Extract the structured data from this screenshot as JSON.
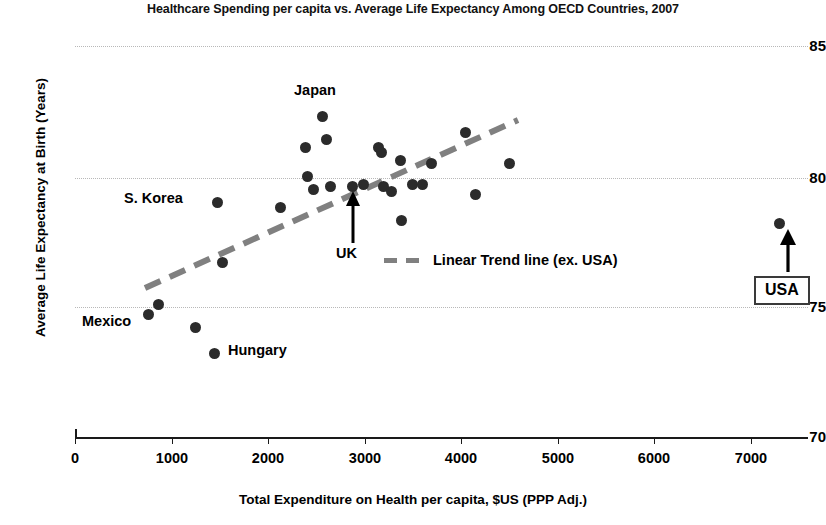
{
  "chart_data": {
    "type": "scatter",
    "title": "Healthcare Spending per capita vs. Average Life Expectancy Among OECD Countries, 2007",
    "xlabel": "Total Expenditure on Health per capita, $US (PPP Adj.)",
    "ylabel": "Average Life Expectancy at Birth (Years)",
    "xlim": [
      0,
      7600
    ],
    "ylim": [
      70,
      85
    ],
    "xticks": [
      0,
      1000,
      2000,
      3000,
      4000,
      5000,
      6000,
      7000
    ],
    "xtick_labels": [
      "0",
      "1000",
      "2000",
      "3000",
      "4000",
      "5000",
      "6000",
      "7000"
    ],
    "yticks": [
      70,
      75,
      80,
      85
    ],
    "ytick_labels": [
      "70",
      "75",
      "80",
      "85"
    ],
    "grid": "horizontal-dotted",
    "marker_color": "#2b2b2b",
    "trendline_color": "#808080",
    "points": [
      {
        "x": 760,
        "y": 74.7,
        "label": "Mexico"
      },
      {
        "x": 870,
        "y": 75.1,
        "label": ""
      },
      {
        "x": 1250,
        "y": 74.2,
        "label": ""
      },
      {
        "x": 1450,
        "y": 73.2,
        "label": "Hungary"
      },
      {
        "x": 1480,
        "y": 79.0,
        "label": "S. Korea"
      },
      {
        "x": 1530,
        "y": 76.7,
        "label": ""
      },
      {
        "x": 2130,
        "y": 78.8,
        "label": ""
      },
      {
        "x": 2390,
        "y": 81.1,
        "label": ""
      },
      {
        "x": 2410,
        "y": 80.0,
        "label": ""
      },
      {
        "x": 2470,
        "y": 79.5,
        "label": ""
      },
      {
        "x": 2570,
        "y": 82.3,
        "label": "Japan"
      },
      {
        "x": 2610,
        "y": 81.4,
        "label": ""
      },
      {
        "x": 2650,
        "y": 79.6,
        "label": ""
      },
      {
        "x": 2880,
        "y": 79.6,
        "label": "UK"
      },
      {
        "x": 2990,
        "y": 79.7,
        "label": ""
      },
      {
        "x": 3150,
        "y": 81.1,
        "label": ""
      },
      {
        "x": 3180,
        "y": 80.9,
        "label": ""
      },
      {
        "x": 3200,
        "y": 79.6,
        "label": ""
      },
      {
        "x": 3280,
        "y": 79.4,
        "label": ""
      },
      {
        "x": 3370,
        "y": 80.6,
        "label": ""
      },
      {
        "x": 3390,
        "y": 78.3,
        "label": ""
      },
      {
        "x": 3500,
        "y": 79.7,
        "label": ""
      },
      {
        "x": 3600,
        "y": 79.7,
        "label": ""
      },
      {
        "x": 3700,
        "y": 80.5,
        "label": ""
      },
      {
        "x": 4050,
        "y": 81.7,
        "label": ""
      },
      {
        "x": 4150,
        "y": 79.3,
        "label": ""
      },
      {
        "x": 4510,
        "y": 80.5,
        "label": ""
      },
      {
        "x": 7300,
        "y": 78.2,
        "label": "USA"
      }
    ],
    "trendline": {
      "label": "Linear Trend line (ex. USA)",
      "x_start": 720,
      "y_start": 75.8,
      "x_end": 4590,
      "y_end": 82.2,
      "style": "dashed",
      "note": "excludes USA"
    },
    "annotations": [
      {
        "text": "Japan",
        "kind": "point-label"
      },
      {
        "text": "S. Korea",
        "kind": "point-label"
      },
      {
        "text": "Mexico",
        "kind": "point-label"
      },
      {
        "text": "Hungary",
        "kind": "point-label"
      },
      {
        "text": "UK",
        "kind": "arrow-callout"
      },
      {
        "text": "USA",
        "kind": "boxed-arrow-callout"
      }
    ]
  },
  "labels": {
    "japan": "Japan",
    "s_korea": "S. Korea",
    "mexico": "Mexico",
    "hungary": "Hungary",
    "uk": "UK",
    "usa": "USA"
  },
  "legend": {
    "trendline_text": "Linear Trend line (ex. USA)"
  }
}
